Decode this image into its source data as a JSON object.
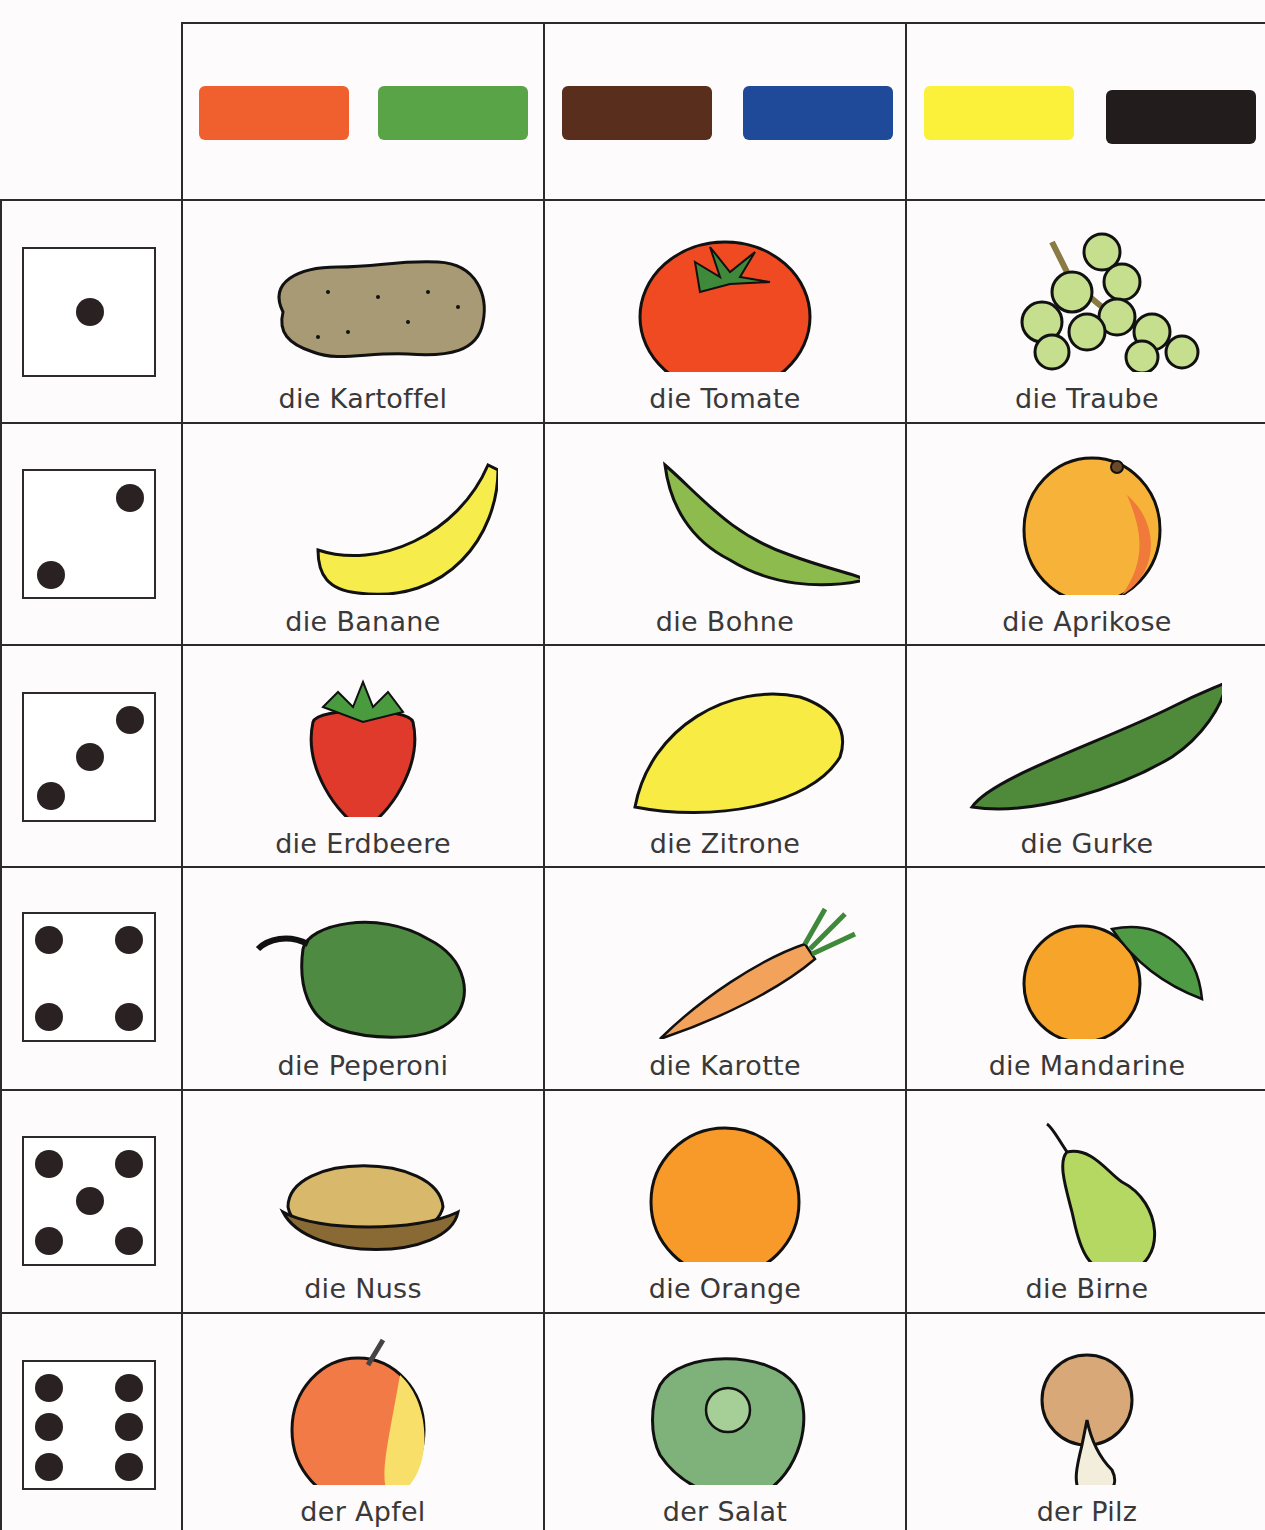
{
  "header": {
    "color_groups": [
      {
        "colors": [
          {
            "name": "orange",
            "hex": "#f0602e"
          },
          {
            "name": "green",
            "hex": "#5aa448"
          }
        ]
      },
      {
        "colors": [
          {
            "name": "brown",
            "hex": "#5a2e1c"
          },
          {
            "name": "blue",
            "hex": "#1f4a9a"
          }
        ]
      },
      {
        "colors": [
          {
            "name": "yellow",
            "hex": "#fbf03a"
          },
          {
            "name": "black",
            "hex": "#231c1c"
          }
        ]
      }
    ]
  },
  "rows": [
    {
      "dice": 1,
      "items": [
        {
          "label": "die Kartoffel",
          "icon": "potato"
        },
        {
          "label": "die Tomate",
          "icon": "tomato"
        },
        {
          "label": "die Traube",
          "icon": "grapes"
        }
      ]
    },
    {
      "dice": 2,
      "items": [
        {
          "label": "die Banane",
          "icon": "banana"
        },
        {
          "label": "die Bohne",
          "icon": "bean"
        },
        {
          "label": "die Aprikose",
          "icon": "apricot"
        }
      ]
    },
    {
      "dice": 3,
      "items": [
        {
          "label": "die Erdbeere",
          "icon": "strawberry"
        },
        {
          "label": "die Zitrone",
          "icon": "lemon"
        },
        {
          "label": "die Gurke",
          "icon": "cucumber"
        }
      ]
    },
    {
      "dice": 4,
      "items": [
        {
          "label": "die Peperoni",
          "icon": "pepper"
        },
        {
          "label": "die Karotte",
          "icon": "carrot"
        },
        {
          "label": "die Mandarine",
          "icon": "mandarin"
        }
      ]
    },
    {
      "dice": 5,
      "items": [
        {
          "label": "die Nuss",
          "icon": "walnut"
        },
        {
          "label": "die Orange",
          "icon": "orange"
        },
        {
          "label": "die Birne",
          "icon": "pear"
        }
      ]
    },
    {
      "dice": 6,
      "items": [
        {
          "label": "der Apfel",
          "icon": "apple"
        },
        {
          "label": "der Salat",
          "icon": "lettuce"
        },
        {
          "label": "der Pilz",
          "icon": "mushroom"
        }
      ]
    }
  ]
}
